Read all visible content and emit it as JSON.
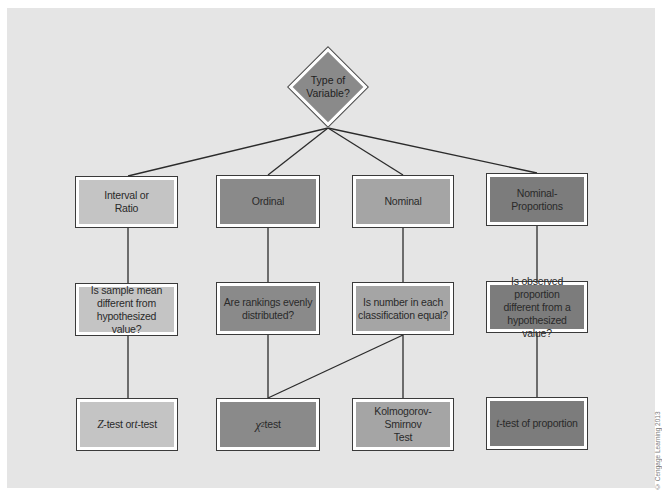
{
  "root": {
    "label": "Type of\nVariable?",
    "shape": "diamond",
    "color": "#8a8a8a"
  },
  "columns": [
    {
      "category": {
        "label": "Interval or\nRatio",
        "color": "#c4c4c4"
      },
      "question": {
        "label": "Is sample mean\ndifferent from\nhypothesized value?",
        "color": "#c4c4c4"
      },
      "test": {
        "prefix": "Z",
        "middle": "-test or ",
        "prefix2": "t",
        "suffix": "-test",
        "label": "Z-test or t-test",
        "color": "#c4c4c4"
      }
    },
    {
      "category": {
        "label": "Ordinal",
        "color": "#8a8a8a"
      },
      "question": {
        "label": "Are rankings evenly\ndistributed?",
        "color": "#8a8a8a"
      },
      "test": {
        "symbol": "χ",
        "superscript": "2",
        "suffix": " test",
        "label": "χ² test",
        "color": "#8a8a8a"
      }
    },
    {
      "category": {
        "label": "Nominal",
        "color": "#a5a5a5"
      },
      "question": {
        "label": "Is number in each\nclassification equal?",
        "color": "#a5a5a5"
      },
      "test": {
        "label": "Kolmogorov-Smirnov\nTest",
        "color": "#a5a5a5"
      }
    },
    {
      "category": {
        "label": "Nominal-\nProportions",
        "color": "#7c7c7c"
      },
      "question": {
        "label": "Is observed proportion\ndifferent from a\nhypothesized value?",
        "color": "#7c7c7c"
      },
      "test": {
        "prefix": "t",
        "suffix": "-test of proportion",
        "label": "t-test of proportion",
        "color": "#7c7c7c"
      }
    }
  ],
  "edges": [
    {
      "from": "root",
      "to": "columns.0.category"
    },
    {
      "from": "root",
      "to": "columns.1.category"
    },
    {
      "from": "root",
      "to": "columns.2.category"
    },
    {
      "from": "root",
      "to": "columns.3.category"
    },
    {
      "from": "columns.0.category",
      "to": "columns.0.question"
    },
    {
      "from": "columns.1.category",
      "to": "columns.1.question"
    },
    {
      "from": "columns.2.category",
      "to": "columns.2.question"
    },
    {
      "from": "columns.3.category",
      "to": "columns.3.question"
    },
    {
      "from": "columns.0.question",
      "to": "columns.0.test"
    },
    {
      "from": "columns.1.question",
      "to": "columns.1.test"
    },
    {
      "from": "columns.2.question",
      "to": "columns.1.test"
    },
    {
      "from": "columns.2.question",
      "to": "columns.2.test"
    },
    {
      "from": "columns.3.question",
      "to": "columns.3.test"
    }
  ],
  "copyright": "© Cengage Learning 2013"
}
